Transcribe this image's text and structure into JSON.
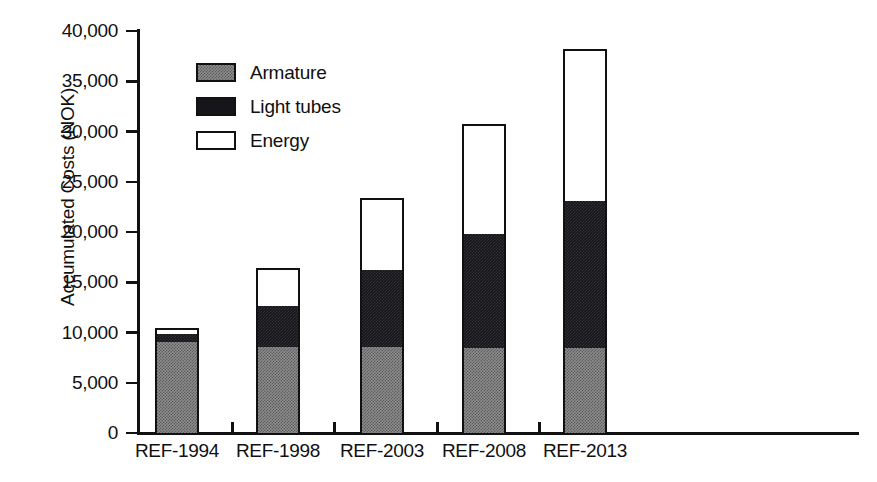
{
  "chart_data": {
    "type": "bar",
    "subtype": "stacked",
    "title": "",
    "xlabel": "",
    "ylabel": "Accumulated Costs (NOK)",
    "ylim": [
      0,
      40000
    ],
    "yticks": [
      0,
      5000,
      10000,
      15000,
      20000,
      25000,
      30000,
      35000,
      40000
    ],
    "ytick_labels": [
      "0",
      "5,000",
      "10,000",
      "15,000",
      "20,000",
      "25,000",
      "30,000",
      "35,000",
      "40,000"
    ],
    "grid": false,
    "legend_position": "upper-left-inside",
    "categories": [
      "REF-1994",
      "REF-1998",
      "REF-2003",
      "REF-2008",
      "REF-2013"
    ],
    "series": [
      {
        "name": "Armature",
        "color": "#8c8c8c",
        "pattern": "gray-dither",
        "values": [
          9100,
          8600,
          8600,
          8500,
          8500
        ]
      },
      {
        "name": "Light tubes",
        "color": "#16161a",
        "pattern": "solid-black",
        "values": [
          700,
          4000,
          7600,
          11300,
          14600
        ]
      },
      {
        "name": "Energy",
        "color": "#ffffff",
        "pattern": "white-outline",
        "values": [
          600,
          3800,
          7200,
          10900,
          15100
        ]
      }
    ],
    "totals": [
      10400,
      16400,
      23400,
      30700,
      38200
    ],
    "cumulative_tops": {
      "armature": [
        9100,
        8600,
        8600,
        8500,
        8500
      ],
      "light_tubes": [
        9800,
        12600,
        16200,
        19800,
        23100
      ],
      "energy": [
        10400,
        16400,
        23400,
        30700,
        38200
      ]
    }
  },
  "legend": {
    "items": [
      {
        "label": "Armature",
        "swatch": "armature-swatch"
      },
      {
        "label": "Light tubes",
        "swatch": "light-tubes-swatch"
      },
      {
        "label": "Energy",
        "swatch": "energy-swatch"
      }
    ]
  },
  "axes": {
    "y_title": "Accumulated Costs (NOK)"
  },
  "colors": {
    "armature": "#8c8c8c",
    "light_tubes": "#16161a",
    "energy": "#ffffff",
    "axis": "#111111",
    "text": "#101010",
    "background": "#ffffff"
  }
}
